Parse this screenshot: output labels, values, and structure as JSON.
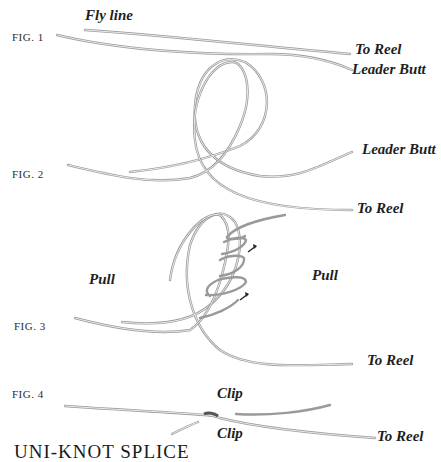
{
  "diagram": {
    "title": "UNI-KNOT SPLICE",
    "figures": [
      {
        "id": "fig1",
        "label": "FIG. 1",
        "callouts": [
          "Fly line",
          "To Reel",
          "Leader Butt"
        ]
      },
      {
        "id": "fig2",
        "label": "FIG. 2",
        "callouts": [
          "Leader Butt",
          "To Reel"
        ]
      },
      {
        "id": "fig3",
        "label": "FIG. 3",
        "callouts": [
          "Pull",
          "Pull",
          "To Reel"
        ]
      },
      {
        "id": "fig4",
        "label": "FIG. 4",
        "callouts": [
          "Clip",
          "Clip",
          "To Reel"
        ]
      }
    ],
    "line_color": "#9a9a9a",
    "text_color": "#1e1e1e",
    "background": "#ffffff"
  }
}
